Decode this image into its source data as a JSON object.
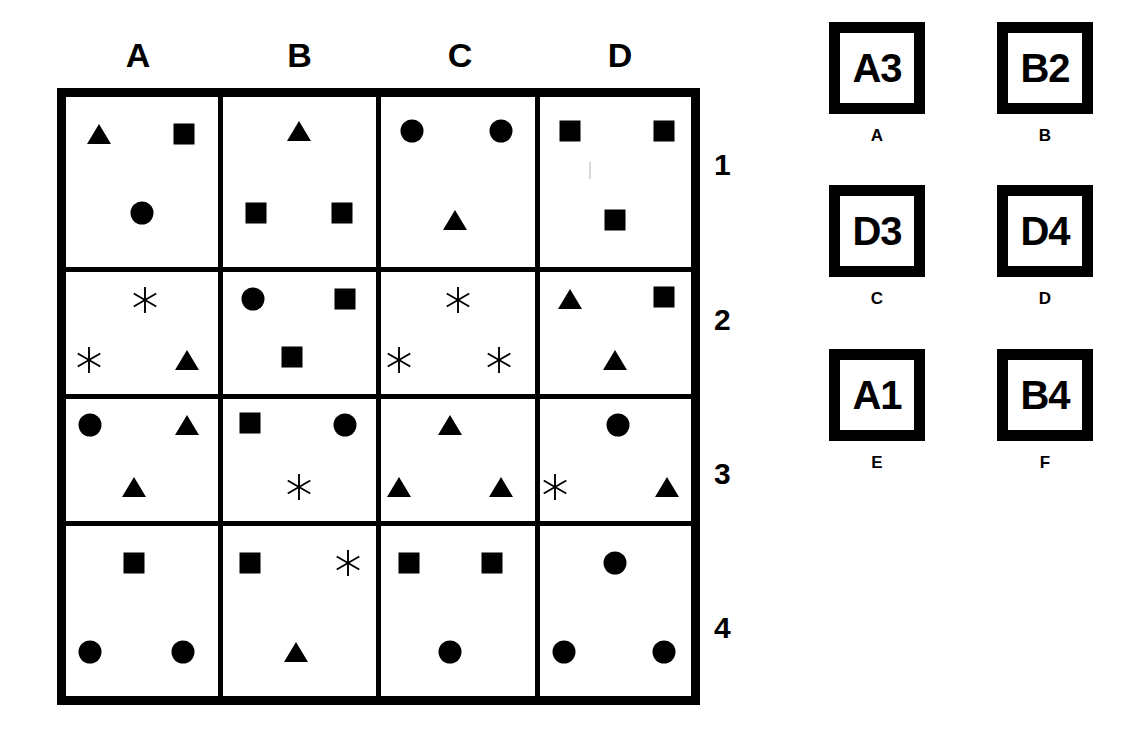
{
  "grid": {
    "column_headers": [
      "A",
      "B",
      "C",
      "D"
    ],
    "row_headers": [
      "1",
      "2",
      "3",
      "4"
    ],
    "cells": [
      {
        "id": "A1",
        "column": "A",
        "row": "1",
        "shapes": [
          {
            "type": "triangle",
            "x": 22,
            "y": 22
          },
          {
            "type": "square",
            "x": 78,
            "y": 22
          },
          {
            "type": "circle",
            "x": 50,
            "y": 68
          }
        ]
      },
      {
        "id": "B1",
        "column": "B",
        "row": "1",
        "shapes": [
          {
            "type": "triangle",
            "x": 50,
            "y": 20
          },
          {
            "type": "square",
            "x": 22,
            "y": 68
          },
          {
            "type": "square",
            "x": 78,
            "y": 68
          }
        ]
      },
      {
        "id": "C1",
        "column": "C",
        "row": "1",
        "shapes": [
          {
            "type": "circle",
            "x": 20,
            "y": 20
          },
          {
            "type": "circle",
            "x": 78,
            "y": 20
          },
          {
            "type": "triangle",
            "x": 48,
            "y": 72
          }
        ]
      },
      {
        "id": "D1",
        "column": "D",
        "row": "1",
        "shapes": [
          {
            "type": "square",
            "x": 20,
            "y": 20
          },
          {
            "type": "square",
            "x": 82,
            "y": 20
          },
          {
            "type": "square",
            "x": 50,
            "y": 72
          }
        ]
      },
      {
        "id": "A2",
        "column": "A",
        "row": "2",
        "shapes": [
          {
            "type": "asterisk",
            "x": 52,
            "y": 23
          },
          {
            "type": "asterisk",
            "x": 15,
            "y": 72
          },
          {
            "type": "triangle",
            "x": 80,
            "y": 72
          }
        ]
      },
      {
        "id": "B2",
        "column": "B",
        "row": "2",
        "shapes": [
          {
            "type": "circle",
            "x": 20,
            "y": 22
          },
          {
            "type": "square",
            "x": 80,
            "y": 22
          },
          {
            "type": "square",
            "x": 45,
            "y": 70
          }
        ]
      },
      {
        "id": "C2",
        "column": "C",
        "row": "2",
        "shapes": [
          {
            "type": "asterisk",
            "x": 50,
            "y": 23
          },
          {
            "type": "asterisk",
            "x": 12,
            "y": 72
          },
          {
            "type": "asterisk",
            "x": 77,
            "y": 72
          }
        ]
      },
      {
        "id": "D2",
        "column": "D",
        "row": "2",
        "shapes": [
          {
            "type": "triangle",
            "x": 20,
            "y": 22
          },
          {
            "type": "square",
            "x": 82,
            "y": 20
          },
          {
            "type": "triangle",
            "x": 50,
            "y": 72
          }
        ]
      },
      {
        "id": "A3",
        "column": "A",
        "row": "3",
        "shapes": [
          {
            "type": "circle",
            "x": 16,
            "y": 21
          },
          {
            "type": "triangle",
            "x": 80,
            "y": 21
          },
          {
            "type": "triangle",
            "x": 45,
            "y": 72
          }
        ]
      },
      {
        "id": "B3",
        "column": "B",
        "row": "3",
        "shapes": [
          {
            "type": "square",
            "x": 18,
            "y": 20
          },
          {
            "type": "circle",
            "x": 80,
            "y": 21
          },
          {
            "type": "asterisk",
            "x": 50,
            "y": 72
          }
        ]
      },
      {
        "id": "C3",
        "column": "C",
        "row": "3",
        "shapes": [
          {
            "type": "triangle",
            "x": 45,
            "y": 21
          },
          {
            "type": "triangle",
            "x": 12,
            "y": 72
          },
          {
            "type": "triangle",
            "x": 78,
            "y": 72
          }
        ]
      },
      {
        "id": "D3",
        "column": "D",
        "row": "3",
        "shapes": [
          {
            "type": "circle",
            "x": 52,
            "y": 21
          },
          {
            "type": "asterisk",
            "x": 10,
            "y": 72
          },
          {
            "type": "triangle",
            "x": 84,
            "y": 72
          }
        ]
      },
      {
        "id": "A4",
        "column": "A",
        "row": "4",
        "shapes": [
          {
            "type": "square",
            "x": 45,
            "y": 22
          },
          {
            "type": "circle",
            "x": 16,
            "y": 74
          },
          {
            "type": "circle",
            "x": 77,
            "y": 74
          }
        ]
      },
      {
        "id": "B4",
        "column": "B",
        "row": "4",
        "shapes": [
          {
            "type": "square",
            "x": 18,
            "y": 22
          },
          {
            "type": "asterisk",
            "x": 82,
            "y": 22
          },
          {
            "type": "triangle",
            "x": 48,
            "y": 74
          }
        ]
      },
      {
        "id": "C4",
        "column": "C",
        "row": "4",
        "shapes": [
          {
            "type": "square",
            "x": 18,
            "y": 22
          },
          {
            "type": "square",
            "x": 72,
            "y": 22
          },
          {
            "type": "circle",
            "x": 45,
            "y": 74
          }
        ]
      },
      {
        "id": "D4",
        "column": "D",
        "row": "4",
        "shapes": [
          {
            "type": "circle",
            "x": 50,
            "y": 22
          },
          {
            "type": "circle",
            "x": 16,
            "y": 74
          },
          {
            "type": "circle",
            "x": 82,
            "y": 74
          }
        ]
      }
    ]
  },
  "options": [
    {
      "letter": "A",
      "code": "A3"
    },
    {
      "letter": "B",
      "code": "B2"
    },
    {
      "letter": "C",
      "code": "D3"
    },
    {
      "letter": "D",
      "code": "D4"
    },
    {
      "letter": "E",
      "code": "A1"
    },
    {
      "letter": "F",
      "code": "B4"
    }
  ],
  "colors": {
    "ink": "#000000",
    "paper": "#ffffff"
  }
}
